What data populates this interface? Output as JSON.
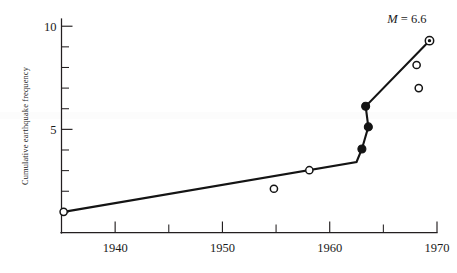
{
  "chart_data": {
    "type": "scatter",
    "title": "",
    "subtitle": "",
    "xlabel": "",
    "ylabel": "Cumulative earthquake frequency",
    "xlim": [
      1935,
      1970
    ],
    "ylim": [
      0,
      10.35
    ],
    "grid": false,
    "legend": "none",
    "x_ticks_labeled": [
      1940,
      1950,
      1960,
      1970
    ],
    "x_tick_labels": [
      "1940",
      "1950",
      "1960",
      "1970"
    ],
    "x_ticks_minor": [
      1935,
      1945,
      1955,
      1965
    ],
    "y_ticks_labeled": [
      5,
      10
    ],
    "y_tick_labels": [
      "5",
      "10"
    ],
    "y_ticks_minor": [
      1,
      2,
      3,
      4,
      6,
      7,
      8,
      9
    ],
    "annotations": [
      {
        "name": "magnitude-label",
        "text_italic": "M",
        "text_rest": " = 6.6",
        "text": "M = 6.6",
        "x": 1967.2,
        "y": 10.15
      }
    ],
    "series": [
      {
        "name": "cumulative-trend-line",
        "type": "line",
        "points": [
          {
            "x": 1935.2,
            "y": 1.0
          },
          {
            "x": 1962.5,
            "y": 3.42
          },
          {
            "x": 1963.0,
            "y": 4.05
          },
          {
            "x": 1963.6,
            "y": 5.12
          },
          {
            "x": 1963.35,
            "y": 6.12
          },
          {
            "x": 1969.3,
            "y": 9.3
          }
        ]
      },
      {
        "name": "open-circle-observations",
        "type": "scatter",
        "marker": "open-circle",
        "points": [
          {
            "x": 1935.2,
            "y": 1.0
          },
          {
            "x": 1954.8,
            "y": 2.12
          },
          {
            "x": 1958.1,
            "y": 3.02
          },
          {
            "x": 1968.1,
            "y": 8.12
          },
          {
            "x": 1968.3,
            "y": 7.0
          }
        ]
      },
      {
        "name": "filled-circle-observations",
        "type": "scatter",
        "marker": "filled-circle",
        "points": [
          {
            "x": 1963.0,
            "y": 4.05
          },
          {
            "x": 1963.6,
            "y": 5.12
          },
          {
            "x": 1963.35,
            "y": 6.12
          }
        ]
      },
      {
        "name": "target-circle-observation",
        "type": "scatter",
        "marker": "target-circle",
        "points": [
          {
            "x": 1969.3,
            "y": 9.3
          }
        ]
      }
    ]
  },
  "figure": {
    "background_color": "#ffffff",
    "ink_color": "#141414"
  }
}
